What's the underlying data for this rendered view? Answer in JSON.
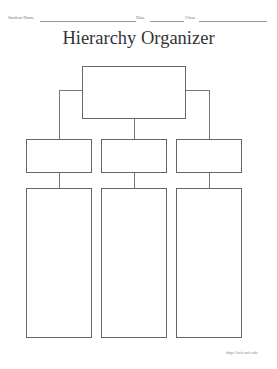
{
  "header": {
    "student_name_label": "Student Name",
    "date_label": "Date",
    "class_label": "Class"
  },
  "title": "Hierarchy Organizer",
  "diagram": {
    "top_box": "",
    "middle_boxes": [
      "",
      "",
      ""
    ],
    "bottom_boxes": [
      "",
      "",
      ""
    ]
  },
  "footer": {
    "url": "http://fcit.usf.edu"
  }
}
